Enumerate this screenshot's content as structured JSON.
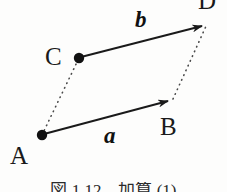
{
  "figure": {
    "type": "vector-parallelogram-diagram",
    "background_color": "#fdfdfc",
    "stroke_color": "#1a1a1a",
    "caption": "図 1.12　加算 (1)",
    "points": [
      {
        "id": "A",
        "label": "A",
        "x": 42,
        "y": 135,
        "dot": true,
        "label_x": 10,
        "label_y": 143
      },
      {
        "id": "B",
        "label": "B",
        "x": 173,
        "y": 99,
        "dot": false,
        "label_x": 160,
        "label_y": 114
      },
      {
        "id": "C",
        "label": "C",
        "x": 79,
        "y": 58,
        "dot": true,
        "label_x": 45,
        "label_y": 44
      },
      {
        "id": "D",
        "label": "D",
        "x": 207,
        "y": 24,
        "dot": false,
        "label_x": 198,
        "label_y": -12
      }
    ],
    "vectors": [
      {
        "id": "a",
        "label": "a",
        "from": "A",
        "to": "B",
        "style": "solid",
        "arrow": true,
        "label_x": 104,
        "label_y": 124
      },
      {
        "id": "b",
        "label": "b",
        "from": "C",
        "to": "D",
        "style": "solid",
        "arrow": true,
        "label_x": 135,
        "label_y": 8
      }
    ],
    "guides": [
      {
        "id": "AC",
        "from": "A",
        "to": "C",
        "style": "dotted",
        "arrow": false
      },
      {
        "id": "BD",
        "from": "B",
        "to": "D",
        "style": "dotted",
        "arrow": false
      }
    ]
  }
}
